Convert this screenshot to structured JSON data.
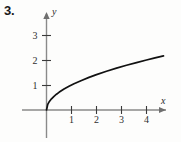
{
  "problem": {
    "number": "3."
  },
  "chart_data": {
    "type": "line",
    "title": "",
    "subtitle": "",
    "xlabel": "x",
    "ylabel": "y",
    "function": "y = sqrt(x)",
    "xlim": [
      -0.95,
      5.4
    ],
    "ylim": [
      -1.15,
      3.65
    ],
    "grid": false,
    "legend": null,
    "axis_arrows": [
      "x-positive",
      "y-positive"
    ],
    "x_ticks": [
      {
        "value": 1,
        "label": "1"
      },
      {
        "value": 2,
        "label": "2"
      },
      {
        "value": 3,
        "label": "3"
      },
      {
        "value": 4,
        "label": "4"
      }
    ],
    "y_ticks": [
      {
        "value": 1,
        "label": "1"
      },
      {
        "value": 2,
        "label": "2"
      },
      {
        "value": 3,
        "label": "3"
      }
    ],
    "series": [
      {
        "name": "y = sqrt(x)",
        "color": "#111111",
        "x": [
          0,
          0.05,
          0.1,
          0.2,
          0.3,
          0.4,
          0.5,
          0.7,
          0.9,
          1.1,
          1.4,
          1.7,
          2.0,
          2.4,
          2.8,
          3.2,
          3.6,
          4.0,
          4.3,
          4.68
        ],
        "values": [
          0,
          0.224,
          0.316,
          0.447,
          0.548,
          0.632,
          0.707,
          0.837,
          0.949,
          1.049,
          1.183,
          1.304,
          1.414,
          1.549,
          1.673,
          1.789,
          1.897,
          2.0,
          2.074,
          2.163
        ]
      }
    ],
    "colors": {
      "curve": "#111111",
      "axis": "#8a8a8a",
      "tick": "#3a3a3a",
      "text": "#2a2a2a",
      "background": "#fdfdfc"
    }
  }
}
